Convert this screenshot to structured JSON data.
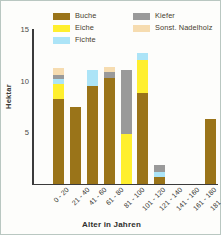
{
  "chart_data": {
    "type": "bar",
    "stacked": true,
    "title": "",
    "xlabel": "Alter in Jahren",
    "ylabel": "Hektar",
    "categories": [
      "0 - 20",
      "21 - 40",
      "41 - 60",
      "61 - 80",
      "81 - 100",
      "101 - 120",
      "121 - 140",
      "141 - 160",
      "161 - 180",
      "181 - 200",
      "201 - 220"
    ],
    "yticks": [
      0,
      5,
      10,
      15
    ],
    "ytick_labels": [
      "0",
      "5",
      "10",
      "15"
    ],
    "ylim": [
      0,
      15
    ],
    "grid": false,
    "legend_position": "top",
    "series": [
      {
        "name": "Buche",
        "color": "#9a7419",
        "values": [
          0.0,
          8.2,
          7.5,
          9.5,
          10.3,
          0.0,
          8.8,
          0.7,
          0.0,
          0.0,
          6.3
        ]
      },
      {
        "name": "Eiche",
        "color": "#ffef2e",
        "values": [
          0.0,
          1.5,
          0.0,
          0.0,
          0.0,
          4.8,
          3.2,
          0.0,
          0.0,
          0.0,
          0.0
        ]
      },
      {
        "name": "Fichte",
        "color": "#ace4f7",
        "values": [
          0.0,
          0.5,
          0.0,
          1.5,
          0.0,
          0.0,
          0.7,
          0.5,
          0.0,
          0.0,
          0.0
        ]
      },
      {
        "name": "Kiefer",
        "color": "#9a9a9a",
        "values": [
          0.0,
          0.4,
          0.0,
          0.0,
          0.5,
          6.2,
          0.0,
          0.6,
          0.0,
          0.0,
          0.0
        ]
      },
      {
        "name": "Sonst. Nadelholz",
        "color": "#f6dcb0",
        "values": [
          0.0,
          0.6,
          0.0,
          0.0,
          0.5,
          0.0,
          0.0,
          0.0,
          0.0,
          0.0,
          0.0
        ]
      }
    ]
  },
  "legend": {
    "columns": [
      {
        "entries": [
          {
            "label": "Buche",
            "color": "#9a7419"
          },
          {
            "label": "Eiche",
            "color": "#ffef2e"
          },
          {
            "label": "Fichte",
            "color": "#ace4f7"
          }
        ]
      },
      {
        "entries": [
          {
            "label": "Kiefer",
            "color": "#9a9a9a"
          },
          {
            "label": "Sonst. Nadelholz",
            "color": "#f6dcb0"
          }
        ]
      }
    ]
  },
  "colors": {
    "background": "#fdfdfb",
    "border": "#b9c7c1",
    "axis": "#3b3b3b",
    "text": "#33332f"
  }
}
